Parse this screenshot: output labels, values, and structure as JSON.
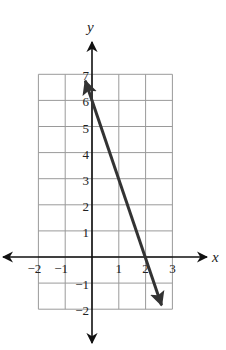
{
  "chart_data": {
    "type": "line",
    "title": "",
    "xlabel": "x",
    "ylabel": "y",
    "xlim": [
      -2,
      3
    ],
    "ylim": [
      -2,
      7
    ],
    "grid": true,
    "x_ticks": [
      {
        "value": -2,
        "label": "−2"
      },
      {
        "value": -1,
        "label": "−1"
      },
      {
        "value": 1,
        "label": "1"
      },
      {
        "value": 2,
        "label": "2"
      },
      {
        "value": 3,
        "label": "3"
      }
    ],
    "y_ticks": [
      {
        "value": -2,
        "label": "−2"
      },
      {
        "value": -1,
        "label": "−1"
      },
      {
        "value": 1,
        "label": "1"
      },
      {
        "value": 2,
        "label": "2"
      },
      {
        "value": 3,
        "label": "3"
      },
      {
        "value": 4,
        "label": "4"
      },
      {
        "value": 5,
        "label": "5"
      },
      {
        "value": 6,
        "label": "6"
      },
      {
        "value": 7,
        "label": "7"
      }
    ],
    "series": [
      {
        "name": "line",
        "equation": "y = -3x + 6",
        "slope": -3,
        "y_intercept": 6,
        "x_intercept": 2,
        "arrows": "both",
        "points": [
          {
            "x": -0.25,
            "y": 6.75
          },
          {
            "x": 0,
            "y": 6
          },
          {
            "x": 2,
            "y": 0
          },
          {
            "x": 2.67,
            "y": -2
          }
        ],
        "color": "#333333"
      }
    ]
  },
  "axes": {
    "x_label": "x",
    "y_label": "y"
  },
  "colors": {
    "grid": "#9a9a9a",
    "axis": "#111111",
    "line": "#333333"
  }
}
